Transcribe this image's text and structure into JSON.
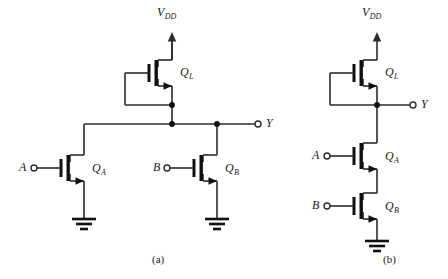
{
  "figure": {
    "width": 448,
    "height": 279,
    "background": "#ffffff",
    "wire_color": "#2b2b2b",
    "device_color": "#101010",
    "text_color": "#1a1a1a"
  },
  "circuits": [
    {
      "id": "a",
      "caption": "(a)",
      "supply_label": "V",
      "supply_sub": "DD",
      "output_label": "Y",
      "inputs": [
        {
          "label": "A",
          "transistor": "Q",
          "transistor_sub": "A"
        },
        {
          "label": "B",
          "transistor": "Q",
          "transistor_sub": "B"
        }
      ],
      "load": {
        "label": "Q",
        "sub": "L"
      }
    },
    {
      "id": "b",
      "caption": "(b)",
      "supply_label": "V",
      "supply_sub": "DD",
      "output_label": "Y",
      "inputs": [
        {
          "label": "A",
          "transistor": "Q",
          "transistor_sub": "A"
        },
        {
          "label": "B",
          "transistor": "Q",
          "transistor_sub": "B"
        }
      ],
      "load": {
        "label": "Q",
        "sub": "L"
      }
    }
  ],
  "labels": {
    "vdd_a": "V",
    "vdd_a_sub": "DD",
    "ql_a": "Q",
    "ql_a_sub": "L",
    "y_a": "Y",
    "a_in_a": "A",
    "qa_a": "Q",
    "qa_a_sub": "A",
    "b_in_a": "B",
    "qb_a": "Q",
    "qb_a_sub": "B",
    "caption_a": "(a)",
    "vdd_b": "V",
    "vdd_b_sub": "DD",
    "ql_b": "Q",
    "ql_b_sub": "L",
    "y_b": "Y",
    "a_in_b": "A",
    "qa_b": "Q",
    "qa_b_sub": "A",
    "b_in_b": "B",
    "qb_b": "Q",
    "qb_b_sub": "B",
    "caption_b": "(b)"
  }
}
